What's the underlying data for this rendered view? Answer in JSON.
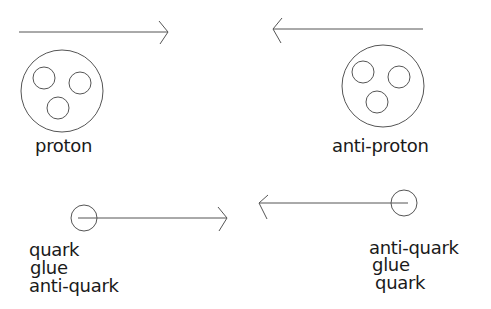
{
  "diagram": {
    "line_color": "#555555",
    "text_color": "#1a1a1a",
    "top": {
      "proton": {
        "label": "proton",
        "direction": "right",
        "constituents": 3
      },
      "antiproton": {
        "label": "anti-proton",
        "direction": "left",
        "constituents": 3
      }
    },
    "bottom": {
      "left_parton": {
        "direction": "right",
        "labels": [
          "quark",
          "glue",
          "anti-quark"
        ]
      },
      "right_parton": {
        "direction": "left",
        "labels": [
          "anti-quark",
          "glue",
          "quark"
        ]
      }
    }
  }
}
